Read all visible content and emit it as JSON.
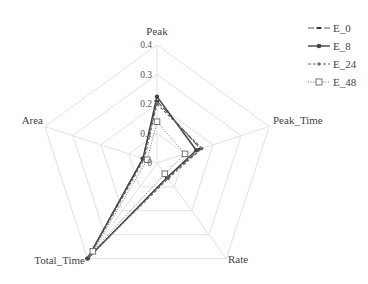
{
  "chart_data": {
    "type": "radar",
    "title": "",
    "axes": [
      "Peak",
      "Peak_Time",
      "Rate",
      "Total_Time",
      "Area"
    ],
    "radial_ticks": [
      "0",
      "0.1",
      "0.2",
      "0.3",
      "0.4"
    ],
    "rlim": [
      0,
      0.4
    ],
    "grid": true,
    "legend_position": "top-right",
    "series": [
      {
        "name": "E_0",
        "values": [
          0.21,
          0.155,
          0.06,
          0.4,
          0.05
        ],
        "style": "long-dash",
        "marker": "dash"
      },
      {
        "name": "E_8",
        "values": [
          0.225,
          0.14,
          0.06,
          0.4,
          0.05
        ],
        "style": "solid",
        "marker": "filled-circle"
      },
      {
        "name": "E_24",
        "values": [
          0.2,
          0.16,
          0.065,
          0.39,
          0.045
        ],
        "style": "dash",
        "marker": "small-diamond"
      },
      {
        "name": "E_48",
        "values": [
          0.14,
          0.1,
          0.045,
          0.37,
          0.035
        ],
        "style": "dotted",
        "marker": "open-square"
      }
    ]
  },
  "labels": {
    "axis_0": "Peak",
    "axis_1": "Peak_Time",
    "axis_2": "Rate",
    "axis_3": "Total_Time",
    "axis_4": "Area",
    "tick_0": "0",
    "tick_1": "0.1",
    "tick_2": "0.2",
    "tick_3": "0.3",
    "tick_4": "0.4"
  },
  "legend": {
    "items": [
      "E_0",
      "E_8",
      "E_24",
      "E_48"
    ]
  }
}
